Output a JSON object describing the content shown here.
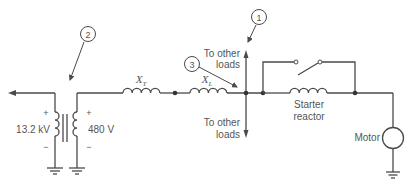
{
  "diagram": {
    "type": "one-line circuit diagram",
    "callouts": [
      {
        "id": "callout-1",
        "label": "1"
      },
      {
        "id": "callout-2",
        "label": "2"
      },
      {
        "id": "callout-3",
        "label": "3"
      }
    ],
    "transformer": {
      "primary_voltage": "13.2 kV",
      "secondary_voltage": "480 V",
      "plus": "+",
      "minus": "−"
    },
    "impedances": {
      "transformer_reactance": {
        "symbol": "X",
        "subscript": "T"
      },
      "line_reactance": {
        "symbol": "X",
        "subscript": "L"
      }
    },
    "loads": {
      "upper": [
        "To other",
        "loads"
      ],
      "lower": [
        "To other",
        "loads"
      ]
    },
    "starter_reactor": [
      "Starter",
      "reactor"
    ],
    "motor": "Motor",
    "colors": {
      "line": "#4a4a4a",
      "text": "#555555",
      "background": "#ffffff"
    }
  }
}
